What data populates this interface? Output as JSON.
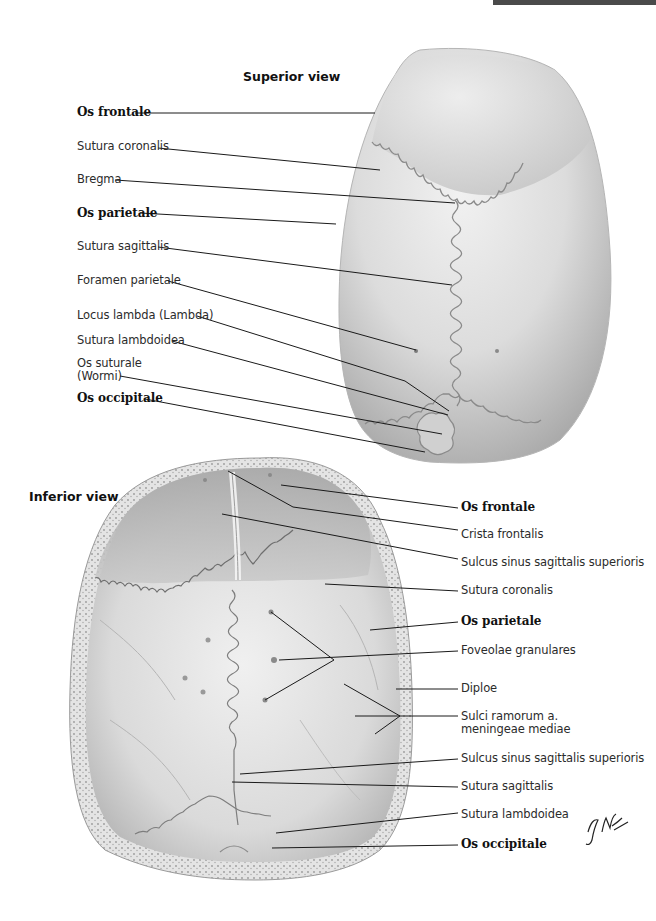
{
  "header": {
    "banner_color": "#4a4a4a"
  },
  "superior_view": {
    "title": "Superior view",
    "labels": [
      {
        "text": "Os frontale",
        "bold": true
      },
      {
        "text": "Sutura coronalis",
        "bold": false
      },
      {
        "text": "Bregma",
        "bold": false
      },
      {
        "text": "Os parietale",
        "bold": true
      },
      {
        "text": "Sutura sagittalis",
        "bold": false
      },
      {
        "text": "Foramen parietale",
        "bold": false
      },
      {
        "text": "Locus lambda (Lambda)",
        "bold": false
      },
      {
        "text": "Sutura lambdoidea",
        "bold": false
      },
      {
        "text": "Os suturale",
        "bold": false
      },
      {
        "text": "(Wormi)",
        "bold": false
      },
      {
        "text": "Os occipitale",
        "bold": true
      }
    ]
  },
  "inferior_view": {
    "title": "Inferior view",
    "labels": [
      {
        "text": "Os frontale",
        "bold": true
      },
      {
        "text": "Crista frontalis",
        "bold": false
      },
      {
        "text": "Sulcus sinus sagittalis superioris",
        "bold": false
      },
      {
        "text": "Sutura coronalis",
        "bold": false
      },
      {
        "text": "Os parietale",
        "bold": true
      },
      {
        "text": "Foveolae granulares",
        "bold": false
      },
      {
        "text": "Diploe",
        "bold": false
      },
      {
        "text": "Sulci ramorum a.",
        "bold": false
      },
      {
        "text": "meningeae mediae",
        "bold": false
      },
      {
        "text": "Sulcus sinus sagittalis superioris",
        "bold": false
      },
      {
        "text": "Sutura sagittalis",
        "bold": false
      },
      {
        "text": "Sutura lambdoidea",
        "bold": false
      },
      {
        "text": "Os occipitale",
        "bold": true
      }
    ]
  },
  "signature": "F. Netter M.D.",
  "colors": {
    "bone": "#d4d4d4",
    "bone_light": "#ececec",
    "bone_dark": "#a8a8a8",
    "leader_line": "#1a1a1a"
  }
}
